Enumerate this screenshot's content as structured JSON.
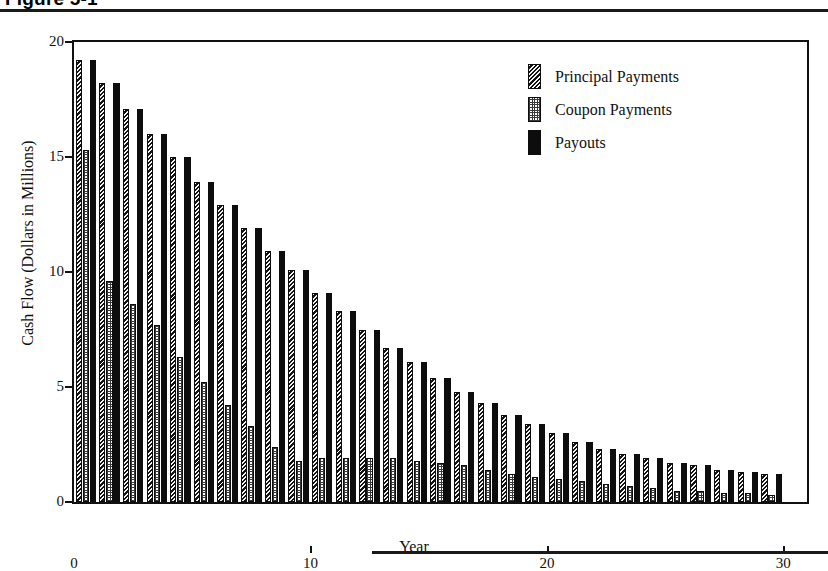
{
  "caption": {
    "text": "Figure 5-1",
    "note": "clipped at top edge of screenshot"
  },
  "chart_data": {
    "type": "bar",
    "title": "",
    "xlabel": "Year",
    "ylabel": "Cash Flow (Dollars in Millions)",
    "xlim": [
      0,
      31
    ],
    "ylim": [
      0,
      20
    ],
    "xticks": [
      "0",
      "10",
      "20",
      "30"
    ],
    "xtick_values": [
      0,
      10,
      20,
      30
    ],
    "yticks": [
      "0",
      "5",
      "10",
      "15",
      "20"
    ],
    "ytick_values": [
      0,
      5,
      10,
      15,
      20
    ],
    "grid": false,
    "legend_position": "upper right",
    "categories": [
      1,
      2,
      3,
      4,
      5,
      6,
      7,
      8,
      9,
      10,
      11,
      12,
      13,
      14,
      15,
      16,
      17,
      18,
      19,
      20,
      21,
      22,
      23,
      24,
      25,
      26,
      27,
      28,
      29,
      30
    ],
    "series": [
      {
        "name": "Principal Payments",
        "pattern": "hatch",
        "values": [
          19.2,
          18.2,
          17.1,
          16.0,
          15.0,
          13.9,
          12.9,
          11.9,
          10.9,
          10.1,
          9.1,
          8.3,
          7.5,
          6.7,
          6.1,
          5.4,
          4.8,
          4.3,
          3.8,
          3.4,
          3.0,
          2.6,
          2.3,
          2.1,
          1.9,
          1.7,
          1.6,
          1.4,
          1.3,
          1.2
        ]
      },
      {
        "name": "Coupon Payments",
        "pattern": "dots",
        "values": [
          15.3,
          9.6,
          8.6,
          7.7,
          6.3,
          5.2,
          4.2,
          3.3,
          2.4,
          1.8,
          1.9,
          1.9,
          1.9,
          1.9,
          1.8,
          1.7,
          1.6,
          1.4,
          1.2,
          1.1,
          1.0,
          0.9,
          0.8,
          0.7,
          0.6,
          0.5,
          0.5,
          0.4,
          0.4,
          0.3
        ]
      },
      {
        "name": "Payouts",
        "pattern": "solid",
        "values": [
          19.2,
          18.2,
          17.1,
          16.0,
          15.0,
          13.9,
          12.9,
          11.9,
          10.9,
          10.1,
          9.1,
          8.3,
          7.5,
          6.7,
          6.1,
          5.4,
          4.8,
          4.3,
          3.8,
          3.4,
          3.0,
          2.6,
          2.3,
          2.1,
          1.9,
          1.7,
          1.6,
          1.4,
          1.3,
          1.2
        ]
      }
    ]
  },
  "legend": {
    "items": [
      {
        "label": "Principal Payments",
        "pattern": "hatch"
      },
      {
        "label": "Coupon Payments",
        "pattern": "dots"
      },
      {
        "label": "Payouts",
        "pattern": "solid"
      }
    ]
  }
}
